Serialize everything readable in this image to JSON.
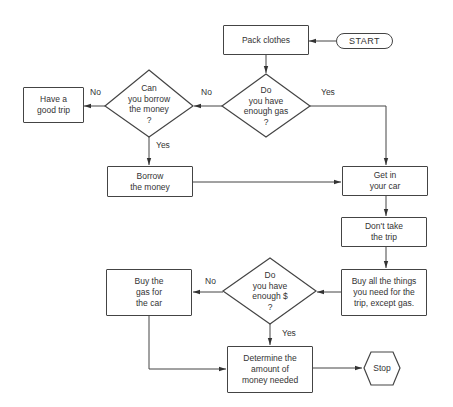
{
  "nodes": {
    "start": "START",
    "pack_clothes": "Pack clothes",
    "enough_gas": "Do\nyou have\nenough gas\n?",
    "can_borrow": "Can\nyou borrow\nthe money\n?",
    "good_trip": "Have a\ngood trip",
    "borrow_money": "Borrow\nthe money",
    "get_in_car": "Get in\nyour car",
    "dont_take_trip": "Don't take\nthe trip",
    "buy_things": "Buy all the things\nyou need for the\ntrip, except gas.",
    "enough_money": "Do\nyou have\nenough $\n?",
    "buy_gas": "Buy the\ngas for\nthe car",
    "determine_amount": "Determine the\namount of\nmoney needed",
    "stop": "Stop"
  },
  "edge_labels": {
    "gas_no": "No",
    "gas_yes": "Yes",
    "borrow_no": "No",
    "borrow_yes": "Yes",
    "money_no": "No",
    "money_yes": "Yes"
  }
}
